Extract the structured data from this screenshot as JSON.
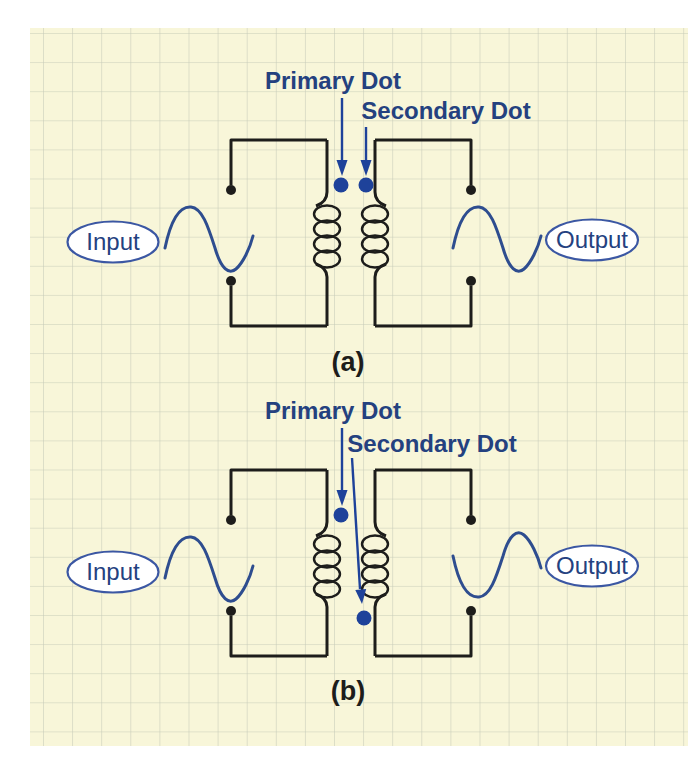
{
  "figure": {
    "colors": {
      "page": "#ffffff",
      "paper": "#f8f6d9",
      "grid": "#c6cbb8",
      "ink": "#1d1d1b",
      "navy": "#24417f",
      "dot": "#1e429a",
      "wave": "#2e4d8f",
      "oval": "#3b57a3"
    },
    "diagrams": [
      {
        "caption": "(a)",
        "primary_dot_label": "Primary Dot",
        "secondary_dot_label": "Secondary Dot",
        "input_label": "Input",
        "output_label": "Output",
        "secondary_dot_position": "top",
        "output_waveform": "in-phase"
      },
      {
        "caption": "(b)",
        "primary_dot_label": "Primary Dot",
        "secondary_dot_label": "Secondary Dot",
        "input_label": "Input",
        "output_label": "Output",
        "secondary_dot_position": "bottom",
        "output_waveform": "inverted"
      }
    ]
  }
}
